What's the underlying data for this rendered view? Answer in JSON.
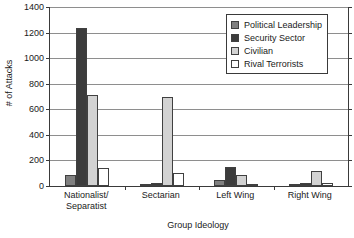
{
  "chart_data": {
    "type": "bar",
    "title": "",
    "xlabel": "Group Ideology",
    "ylabel": "# of Attacks",
    "categories": [
      "Nationalist/ Separatist",
      "Sectarian",
      "Left Wing",
      "Right Wing"
    ],
    "category_lines": [
      [
        "Nationalist/",
        "Separatist"
      ],
      [
        "Sectarian"
      ],
      [
        "Left Wing"
      ],
      [
        "Right Wing"
      ]
    ],
    "series": [
      {
        "name": "Political Leadership",
        "color": "#808080",
        "values": [
          85,
          12,
          45,
          10
        ]
      },
      {
        "name": "Security Sector",
        "color": "#3c3c3c",
        "values": [
          1235,
          20,
          150,
          20
        ]
      },
      {
        "name": "Civilian",
        "color": "#d2d2d2",
        "values": [
          710,
          700,
          90,
          120
        ]
      },
      {
        "name": "Rival Terrorists",
        "color": "#ffffff",
        "values": [
          140,
          100,
          10,
          25
        ]
      }
    ],
    "ylim": [
      0,
      1400
    ],
    "yticks": [
      0,
      200,
      400,
      600,
      800,
      1000,
      1200,
      1400
    ],
    "ytick_labels": [
      "0",
      "200",
      "400",
      "600",
      "800",
      "1000",
      "1200",
      "1400"
    ],
    "grid": true,
    "legend_position": "top-right"
  }
}
